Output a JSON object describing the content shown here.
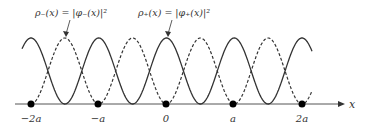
{
  "diagram": {
    "type": "wavefunction-density-plot",
    "labels": {
      "rho_minus": "ρ₋(x) = |φ₋(x)|²",
      "rho_plus": "ρ₊(x) = |φ₊(x)|²",
      "x_axis": "x"
    },
    "tick_labels": [
      "−2a",
      "−a",
      "0",
      "a",
      "2a"
    ],
    "curves": [
      {
        "name": "rho_plus",
        "style": "solid",
        "description": "maxima at lattice sites"
      },
      {
        "name": "rho_minus",
        "style": "dashed",
        "description": "zeros at lattice sites, maxima midway"
      }
    ],
    "lattice_sites": 5,
    "colors": {
      "curve": "#333333",
      "axis": "#555555",
      "dot": "#000000"
    }
  }
}
